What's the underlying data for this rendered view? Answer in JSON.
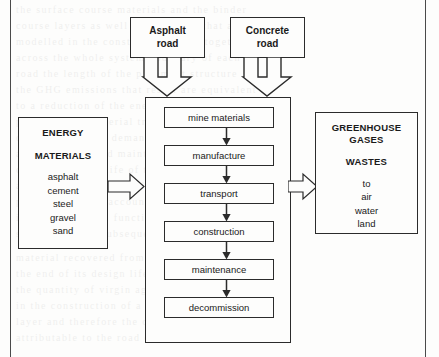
{
  "diagram": {
    "sources": [
      {
        "id": "asphalt-road",
        "label": "Asphalt\nroad",
        "line1": "Asphalt",
        "line2": "road"
      },
      {
        "id": "concrete-road",
        "label": "Concrete\nroad",
        "line1": "Concrete",
        "line2": "road"
      }
    ],
    "inputs": {
      "heading_1": "ENERGY",
      "heading_2": "MATERIALS",
      "items": [
        "asphalt",
        "cement",
        "steel",
        "gravel",
        "sand"
      ]
    },
    "lifecycle": {
      "stages": [
        "mine materials",
        "manufacture",
        "transport",
        "construction",
        "maintenance",
        "decommission"
      ]
    },
    "outputs": {
      "heading_1": "GREENHOUSE",
      "heading_2": "GASES",
      "heading_3": "WASTES",
      "items": [
        "to",
        "air",
        "water",
        "land"
      ]
    },
    "colors": {
      "stroke": "#2b2b2b",
      "frame": "#4a4a4a",
      "paper": "#fdfdfc",
      "text": "#1a1a1a"
    }
  }
}
